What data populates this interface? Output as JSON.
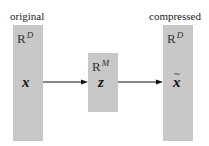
{
  "diagram": {
    "type": "dimensionality-reduction-flow",
    "nodes": [
      {
        "id": "original",
        "caption": "original",
        "space": "R",
        "space_dim": "D",
        "variable": "x"
      },
      {
        "id": "latent",
        "caption": "",
        "space": "R",
        "space_dim": "M",
        "variable": "z"
      },
      {
        "id": "compressed",
        "caption": "compressed",
        "space": "R",
        "space_dim": "D",
        "variable": "x",
        "variable_accent": "tilde"
      }
    ],
    "edges": [
      {
        "from": "original",
        "to": "latent"
      },
      {
        "from": "latent",
        "to": "compressed"
      }
    ],
    "colors": {
      "box_fill": "#c8c8c8",
      "arrow": "#111111",
      "text": "#222222"
    }
  }
}
